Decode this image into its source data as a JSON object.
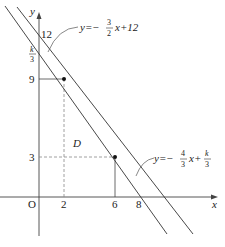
{
  "diagram": {
    "type": "coordinate-plane",
    "axes": {
      "x_label": "x",
      "y_label": "y",
      "origin_label": "O"
    },
    "x_ticks": [
      "2",
      "6",
      "8"
    ],
    "y_ticks": [
      "3",
      "9",
      "12"
    ],
    "y_tick_fraction": {
      "numerator": "k",
      "denominator": "3"
    },
    "region_label": "D",
    "lines": [
      {
        "id": "line1",
        "equation_prefix": "y=−",
        "slope_num": "3",
        "slope_den": "2",
        "equation_suffix": "x+12"
      },
      {
        "id": "line2",
        "equation_prefix": "y=−",
        "slope_num": "4",
        "slope_den": "3",
        "equation_mid": "x+",
        "intercept_num": "k",
        "intercept_den": "3"
      }
    ],
    "points": [
      {
        "x": 2,
        "y": 9
      },
      {
        "x": 6,
        "y": 3
      }
    ],
    "colors": {
      "line": "#333333",
      "dashed": "#888888",
      "background": "#ffffff"
    }
  }
}
